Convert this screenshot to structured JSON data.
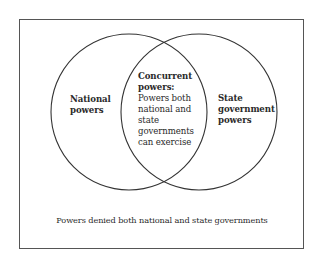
{
  "diagram": {
    "type": "venn",
    "colors": {
      "stroke": "#333333",
      "frame": "#555555",
      "text": "#2a2a2a",
      "background": "#ffffff"
    },
    "frame": {
      "label": "Powers denied both national and state governments"
    },
    "sets": [
      {
        "id": "national",
        "title_lines": [
          "National",
          "powers"
        ]
      },
      {
        "id": "state",
        "title_lines": [
          "State",
          "government",
          "powers"
        ]
      }
    ],
    "intersection": {
      "title_lines": [
        "Concurrent",
        "powers:"
      ],
      "description_lines": [
        "Powers both",
        "national and",
        "state",
        "governments",
        "can exercise"
      ]
    }
  }
}
